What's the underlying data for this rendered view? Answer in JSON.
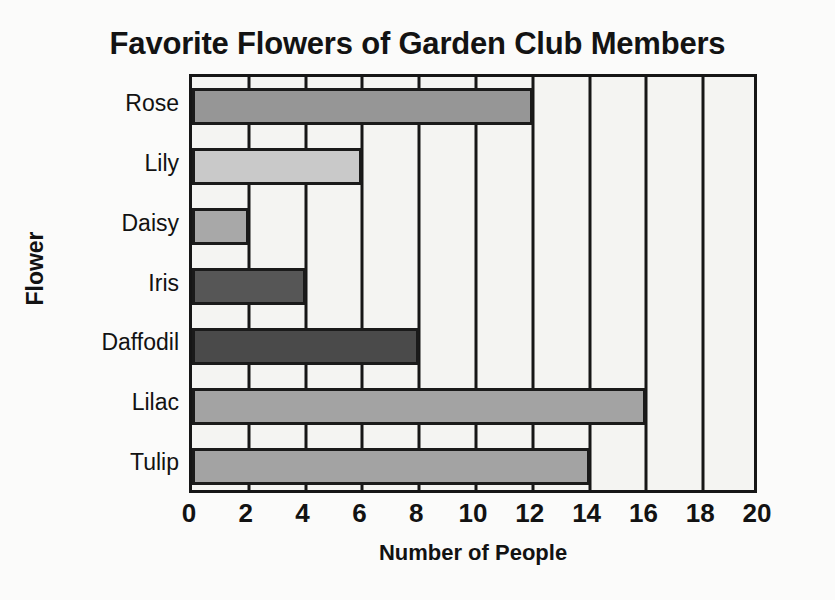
{
  "chart_data": {
    "type": "bar",
    "orientation": "horizontal",
    "title": "Favorite Flowers of Garden Club Members",
    "xlabel": "Number of People",
    "ylabel": "Flower",
    "categories": [
      "Rose",
      "Lily",
      "Daisy",
      "Iris",
      "Daffodil",
      "Lilac",
      "Tulip"
    ],
    "values": [
      12,
      6,
      2,
      4,
      8,
      16,
      14
    ],
    "bar_colors": [
      "#969696",
      "#c9c9c9",
      "#a8a8a8",
      "#565656",
      "#4a4a4a",
      "#a3a3a3",
      "#a3a3a3"
    ],
    "xlim": [
      0,
      20
    ],
    "xticks": [
      0,
      2,
      4,
      6,
      8,
      10,
      12,
      14,
      16,
      18,
      20
    ],
    "xtick_labels": [
      "0",
      "2",
      "4",
      "6",
      "8",
      "10",
      "12",
      "14",
      "16",
      "18",
      "20"
    ],
    "grid": "vertical",
    "legend": "none",
    "plot_background": "#f4f4f2",
    "axis_color": "#161616"
  }
}
